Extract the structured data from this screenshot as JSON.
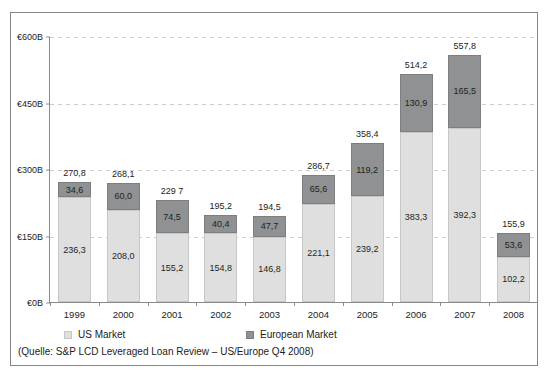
{
  "chart_data": {
    "type": "bar",
    "stacked": true,
    "title": "",
    "categories": [
      "1999",
      "2000",
      "2001",
      "2002",
      "2003",
      "2004",
      "2005",
      "2006",
      "2007",
      "2008"
    ],
    "series": [
      {
        "name": "US Market",
        "color": "#dedfde",
        "values": [
          236.3,
          208.0,
          155.2,
          154.8,
          146.8,
          221.1,
          239.2,
          383.3,
          392.3,
          102.2
        ],
        "labels": [
          "236,3",
          "208,0",
          "155,2",
          "154,8",
          "146,8",
          "221,1",
          "239,2",
          "383,3",
          "392,3",
          "102,2"
        ]
      },
      {
        "name": "European Market",
        "color": "#8f9192",
        "values": [
          34.6,
          60.0,
          74.5,
          40.4,
          47.7,
          65.6,
          119.2,
          130.9,
          165.5,
          53.6
        ],
        "labels": [
          "34,6",
          "60,0",
          "74,5",
          "40,4",
          "47,7",
          "65,6",
          "119,2",
          "130,9",
          "165,5",
          "53,6"
        ]
      }
    ],
    "totals": [
      270.8,
      268.1,
      229.7,
      195.2,
      194.5,
      286.7,
      358.4,
      514.2,
      557.8,
      155.9
    ],
    "total_labels": [
      "270,8",
      "268,1",
      "229 7",
      "195,2",
      "194,5",
      "286,7",
      "358,4",
      "514,2",
      "557,8",
      "155,9"
    ],
    "xlabel": "",
    "ylabel": "",
    "ylim": [
      0,
      600
    ],
    "y_ticks": [
      {
        "label": "€600B",
        "value": 600
      },
      {
        "label": "€450B",
        "value": 450
      },
      {
        "label": "€300B",
        "value": 300
      },
      {
        "label": "€150B",
        "value": 150
      },
      {
        "label": "€0B",
        "value": 0
      }
    ],
    "gridline_values": [
      600,
      450,
      300,
      150
    ],
    "grid": "dashed",
    "legend_position": "bottom"
  },
  "legend": {
    "us_label": "US Market",
    "eu_label": "European Market"
  },
  "source": "(Quelle: S&P LCD Leveraged Loan Review – US/Europe Q4 2008)"
}
